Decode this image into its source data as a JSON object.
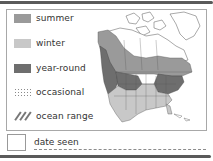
{
  "legend": {
    "items": [
      {
        "label": "summer",
        "swatch": "solid",
        "color": "#9a9a9a"
      },
      {
        "label": "winter",
        "swatch": "solid",
        "color": "#c8c8c8"
      },
      {
        "label": "year-round",
        "swatch": "solid",
        "color": "#6e6e6e"
      },
      {
        "label": "occasional",
        "swatch": "dotted",
        "color": "#8a8a8a"
      },
      {
        "label": "ocean range",
        "swatch": "hatched",
        "color": "#777777"
      }
    ]
  },
  "map": {
    "region": "North America",
    "range_colors": {
      "summer": "#9a9a9a",
      "winter": "#c8c8c8",
      "year_round": "#6e6e6e"
    }
  },
  "date_seen": {
    "label": "date seen",
    "value": ""
  },
  "colors": {
    "frame": "#a8a8a8",
    "rule": "#5a5a5a",
    "text": "#333333"
  }
}
